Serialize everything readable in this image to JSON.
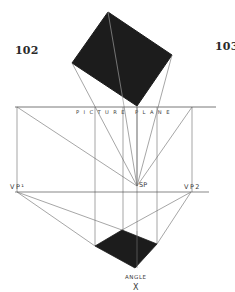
{
  "page_numbers": {
    "left": "102",
    "right": "103"
  },
  "labels": {
    "picture_plane": "PICTURE PLANE",
    "picture_plane_letters": [
      "P",
      "I",
      "C",
      "T",
      "U",
      "R",
      "E",
      "",
      "P",
      "L",
      "A",
      "N",
      "E"
    ],
    "vp1": "VP¹",
    "vp2": "VP2",
    "sp": "SP",
    "angle": "ANGLE",
    "angle_symbol": "X"
  },
  "colors": {
    "ink": "#1c1c1c",
    "line": "#6a6a6a",
    "paper": "#ffffff"
  },
  "geometry": {
    "plan_square": [
      [
        108,
        12
      ],
      [
        172,
        55
      ],
      [
        137,
        106
      ],
      [
        72,
        63
      ]
    ],
    "picture_plane_y": 107,
    "picture_plane_x": [
      15,
      216
    ],
    "horizon_y": 192,
    "horizon_x": [
      15,
      209
    ],
    "station_point": [
      137,
      186
    ],
    "vp1": [
      17,
      192
    ],
    "vp2": [
      191,
      192
    ],
    "perspective_square": [
      [
        122,
        230
      ],
      [
        157,
        244
      ],
      [
        135,
        268
      ],
      [
        95,
        246
      ]
    ],
    "verticals_x": [
      95,
      123,
      137,
      157
    ]
  }
}
